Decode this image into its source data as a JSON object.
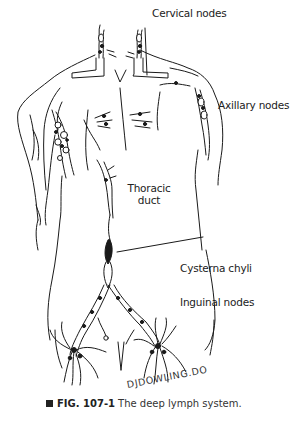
{
  "figure": {
    "title": "The deep lymph system",
    "labels": {
      "cervical": "Cervical nodes",
      "axillary": "Axillary nodes",
      "thoracic_line1": "Thoracic",
      "thoracic_line2": "duct",
      "cisterna": "Cysterna chyli",
      "inguinal": "Inguinal nodes"
    },
    "signature": "DJDOWLING.DO",
    "caption": {
      "number": "FIG. 107-1",
      "text": "The deep lymph system."
    }
  }
}
